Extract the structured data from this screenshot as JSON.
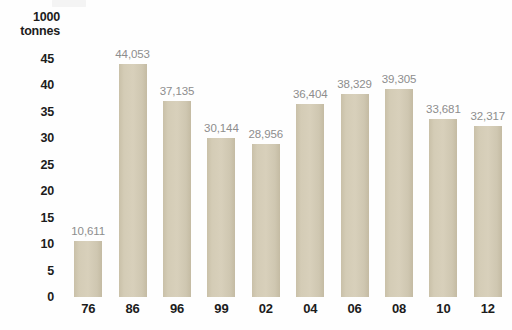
{
  "chart_data": {
    "type": "bar",
    "title": "",
    "subtitle": "",
    "xlabel": "",
    "ylabel": "1000 tonnes",
    "ylabel_lines": [
      "1000",
      "tonnes"
    ],
    "categories": [
      "76",
      "86",
      "96",
      "99",
      "02",
      "04",
      "06",
      "08",
      "10",
      "12"
    ],
    "values": [
      10611,
      44053,
      37135,
      30144,
      28956,
      36404,
      38329,
      39305,
      33681,
      32317
    ],
    "data_labels": [
      "10,611",
      "44,053",
      "37,135",
      "30,144",
      "28,956",
      "36,404",
      "38,329",
      "39,305",
      "33,681",
      "32,317"
    ],
    "y_ticks": [
      0,
      5,
      10,
      15,
      20,
      25,
      30,
      35,
      40,
      45
    ],
    "y_tick_labels": [
      "0",
      "5",
      "10",
      "15",
      "20",
      "25",
      "30",
      "35",
      "40",
      "45"
    ],
    "ylim": [
      0,
      45
    ],
    "value_scale_divisor": 1000,
    "grid": false,
    "legend": false,
    "legend_position": "none",
    "bar_color": "#d4ccb6",
    "label_color": "#8d8d8d",
    "axis_text_color": "#1c1c1c",
    "background_color": "#fefefe"
  }
}
